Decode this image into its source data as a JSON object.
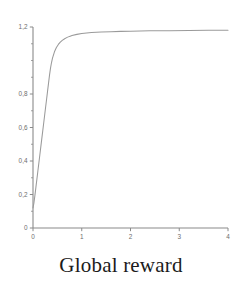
{
  "caption": "Global reward",
  "colors": {
    "background": "#ffffff",
    "axis": "#8a8a8a",
    "curve": "#9a9a9a",
    "tick_label": "#6d6d6d",
    "caption": "#1b1b1b"
  },
  "chart_data": {
    "type": "line",
    "title": "Global reward",
    "xlabel": "",
    "ylabel": "",
    "xlim": [
      0,
      4
    ],
    "ylim": [
      0,
      1.2
    ],
    "grid": false,
    "legend": null,
    "x_ticks": [
      "0",
      "1",
      "2",
      "3",
      "4"
    ],
    "x_tick_values": [
      0,
      1,
      2,
      3,
      4
    ],
    "y_ticks": [
      "0",
      "0,2",
      "0,4",
      "0,6",
      "0,8",
      "1,2"
    ],
    "y_tick_values": [
      0,
      0.2,
      0.4,
      0.6,
      0.8,
      1.2
    ],
    "y_minor_tick_values": [
      0.1,
      0.3,
      0.5,
      0.7,
      0.9,
      1.0,
      1.1
    ],
    "series": [
      {
        "name": "Global reward",
        "x": [
          0.0,
          0.02,
          0.04,
          0.06,
          0.08,
          0.1,
          0.12,
          0.14,
          0.16,
          0.18,
          0.2,
          0.22,
          0.24,
          0.26,
          0.28,
          0.3,
          0.32,
          0.34,
          0.36,
          0.38,
          0.4,
          0.44,
          0.48,
          0.52,
          0.56,
          0.6,
          0.65,
          0.7,
          0.75,
          0.8,
          0.9,
          1.0,
          1.2,
          1.4,
          1.6,
          1.8,
          2.0,
          2.4,
          2.8,
          3.2,
          3.6,
          4.0
        ],
        "y": [
          0.12,
          0.152,
          0.196,
          0.244,
          0.292,
          0.34,
          0.388,
          0.436,
          0.484,
          0.532,
          0.58,
          0.628,
          0.676,
          0.724,
          0.772,
          0.82,
          0.868,
          0.916,
          0.956,
          0.988,
          1.014,
          1.052,
          1.078,
          1.096,
          1.11,
          1.12,
          1.13,
          1.138,
          1.144,
          1.149,
          1.156,
          1.161,
          1.167,
          1.17,
          1.172,
          1.174,
          1.175,
          1.177,
          1.178,
          1.179,
          1.18,
          1.181
        ]
      }
    ]
  }
}
